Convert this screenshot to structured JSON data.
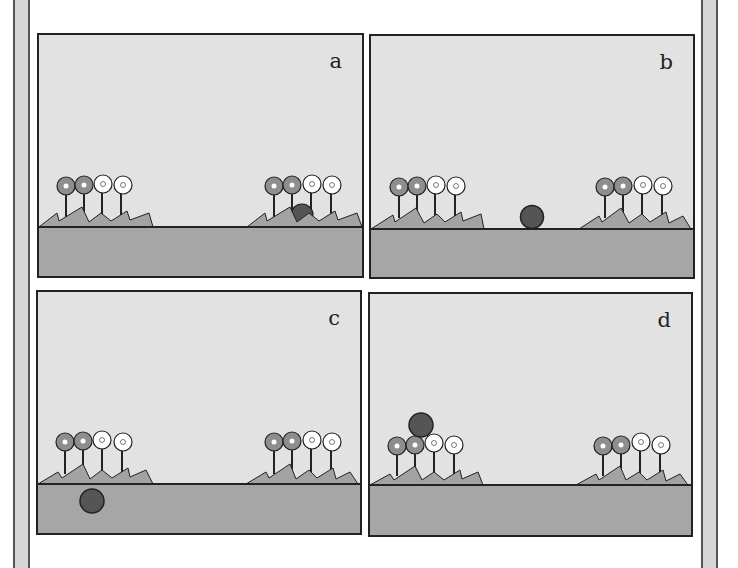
{
  "figure": {
    "colors": {
      "sky": "#e2e2e2",
      "ground": "#a6a6a6",
      "grass": "#a3a3a3",
      "ball": "#555555",
      "flower_gray": "#8e8e8e",
      "flower_white": "#ffffff",
      "outline": "#222222"
    },
    "panels": [
      {
        "label": "a",
        "ball": "partially hidden behind right flower bed"
      },
      {
        "label": "b",
        "ball": "on ground line between flower beds"
      },
      {
        "label": "c",
        "ball": "below ground line, left"
      },
      {
        "label": "d",
        "ball": "above left flower bed"
      }
    ]
  }
}
